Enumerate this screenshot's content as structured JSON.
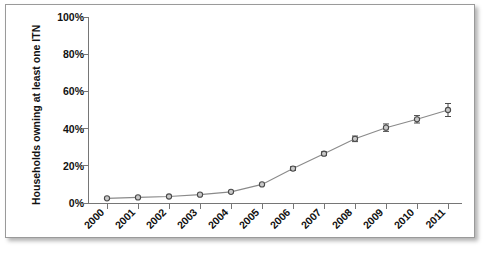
{
  "chart_data": {
    "type": "line",
    "title": "",
    "xlabel": "",
    "ylabel": "Households owning at least one ITN",
    "categories": [
      "2000",
      "2001",
      "2002",
      "2003",
      "2004",
      "2005",
      "2006",
      "2007",
      "2008",
      "2009",
      "2010",
      "2011"
    ],
    "x": [
      2000,
      2001,
      2002,
      2003,
      2004,
      2005,
      2006,
      2007,
      2008,
      2009,
      2010,
      2011
    ],
    "values": [
      2.5,
      3,
      3.5,
      4.5,
      6,
      10,
      18.5,
      26.5,
      34.5,
      40.5,
      45,
      50
    ],
    "error_low": [
      2.5,
      3,
      3.5,
      4.5,
      6,
      10,
      17.5,
      25.5,
      33,
      38.5,
      43,
      46.5
    ],
    "error_high": [
      2.5,
      3,
      3.5,
      4.5,
      6,
      10,
      19.5,
      27.5,
      36,
      42.5,
      47,
      53.5
    ],
    "ylim": [
      0,
      100
    ],
    "yticks": [
      0,
      20,
      40,
      60,
      80,
      100
    ],
    "ytick_labels": [
      "0%",
      "20%",
      "40%",
      "60%",
      "80%",
      "100%"
    ],
    "grid": false,
    "legend": "none",
    "marker": "open-circle",
    "colors": {
      "line": "#8a8a8a",
      "marker_fill": "#c9c9c9",
      "marker_edge": "#4a4a4a",
      "axis": "#767676",
      "text": "#111111",
      "background": "#ffffff",
      "frame_border": "#9a9a9a"
    }
  }
}
